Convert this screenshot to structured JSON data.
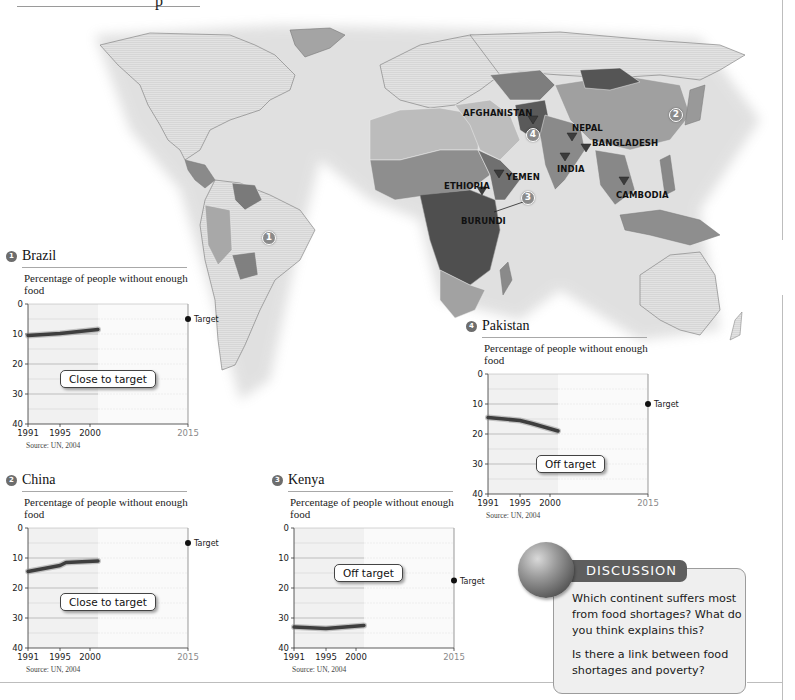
{
  "page": {
    "header_fragment": "p"
  },
  "map": {
    "country_labels": [
      {
        "name": "AFGHANISTAN",
        "x": 463,
        "y": 108
      },
      {
        "name": "NEPAL",
        "x": 572,
        "y": 123
      },
      {
        "name": "BANGLADESH",
        "x": 592,
        "y": 138
      },
      {
        "name": "INDIA",
        "x": 557,
        "y": 164
      },
      {
        "name": "YEMEN",
        "x": 506,
        "y": 172
      },
      {
        "name": "ETHIOPIA",
        "x": 444,
        "y": 181
      },
      {
        "name": "BURUNDI",
        "x": 461,
        "y": 216
      },
      {
        "name": "CAMBODIA",
        "x": 616,
        "y": 190
      }
    ],
    "markers": [
      {
        "num": "1",
        "x": 269,
        "y": 238
      },
      {
        "num": "2",
        "x": 676,
        "y": 115
      },
      {
        "num": "3",
        "x": 528,
        "y": 198
      },
      {
        "num": "4",
        "x": 533,
        "y": 135
      }
    ],
    "hunger_triangles": [
      {
        "country": "AFGHANISTAN",
        "x": 533,
        "y": 120
      },
      {
        "country": "NEPAL",
        "x": 572,
        "y": 137
      },
      {
        "country": "BANGLADESH",
        "x": 586,
        "y": 148
      },
      {
        "country": "INDIA",
        "x": 565,
        "y": 157
      },
      {
        "country": "YEMEN",
        "x": 499,
        "y": 174
      },
      {
        "country": "ETHIOPIA",
        "x": 482,
        "y": 191
      },
      {
        "country": "CAMBODIA",
        "x": 624,
        "y": 181
      }
    ],
    "shade_colors": {
      "lowest": "#e6e6e6",
      "low": "#bdbdbd",
      "medium": "#9a9a9a",
      "high": "#777777",
      "highest": "#4f4f4f"
    }
  },
  "charts": {
    "brazil": {
      "num": "1",
      "title": "Brazil",
      "subtitle": "Percentage of people without enough food",
      "status": "Close to target",
      "source": "Source: UN, 2004",
      "target_label": "Target"
    },
    "china": {
      "num": "2",
      "title": "China",
      "subtitle": "Percentage of people without enough food",
      "status": "Close to target",
      "source": "Source: UN, 2004",
      "target_label": "Target"
    },
    "kenya": {
      "num": "3",
      "title": "Kenya",
      "subtitle": "Percentage of people without enough food",
      "status": "Off target",
      "source": "Source: UN, 2004",
      "target_label": "Target"
    },
    "pakistan": {
      "num": "4",
      "title": "Pakistan",
      "subtitle": "Percentage of people without enough food",
      "status": "Off target",
      "source": "Source: UN, 2004",
      "target_label": "Target"
    }
  },
  "discussion": {
    "title": "DISCUSSION",
    "question1": "Which continent suffers most from food shortages? What do you think explains this?",
    "question2": "Is there a link between food shortages and poverty?"
  },
  "chart_data": [
    {
      "type": "line",
      "title": "Brazil — Percentage of people without enough food",
      "xlabel": "",
      "ylabel": "Percentage of people without enough food",
      "x_ticks": [
        "1991",
        "1995",
        "2000",
        "2015"
      ],
      "y_ticks": [
        0,
        10,
        20,
        30,
        40
      ],
      "ylim": [
        40,
        0
      ],
      "y_inverted": true,
      "x": [
        1991,
        1995,
        2001
      ],
      "series": [
        {
          "name": "Brazil",
          "values": [
            10.5,
            9.8,
            8.5
          ]
        }
      ],
      "target": {
        "x": 2015,
        "y": 5,
        "label": "Target"
      },
      "annotation": "Close to target",
      "source": "Source: UN, 2004",
      "grid": true
    },
    {
      "type": "line",
      "title": "China — Percentage of people without enough food",
      "xlabel": "",
      "ylabel": "Percentage of people without enough food",
      "x_ticks": [
        "1991",
        "1995",
        "2000",
        "2015"
      ],
      "y_ticks": [
        0,
        10,
        20,
        30,
        40
      ],
      "ylim": [
        40,
        0
      ],
      "y_inverted": true,
      "x": [
        1991,
        1995,
        1996,
        2001
      ],
      "series": [
        {
          "name": "China",
          "values": [
            14.5,
            12.5,
            11.5,
            11
          ]
        }
      ],
      "target": {
        "x": 2015,
        "y": 5,
        "label": "Target"
      },
      "annotation": "Close to target",
      "source": "Source: UN, 2004",
      "grid": true
    },
    {
      "type": "line",
      "title": "Kenya — Percentage of people without enough food",
      "xlabel": "",
      "ylabel": "Percentage of people without enough food",
      "x_ticks": [
        "1991",
        "1995",
        "2000",
        "2015"
      ],
      "y_ticks": [
        0,
        10,
        20,
        30,
        40
      ],
      "ylim": [
        40,
        0
      ],
      "y_inverted": true,
      "x": [
        1991,
        1995,
        2001
      ],
      "series": [
        {
          "name": "Kenya",
          "values": [
            33,
            33.5,
            32.5
          ]
        }
      ],
      "target": {
        "x": 2015,
        "y": 17.5,
        "label": "Target"
      },
      "annotation": "Off target",
      "source": "Source: UN, 2004",
      "grid": true
    },
    {
      "type": "line",
      "title": "Pakistan — Percentage of people without enough food",
      "xlabel": "",
      "ylabel": "Percentage of people without enough food",
      "x_ticks": [
        "1991",
        "1995",
        "2000",
        "2015"
      ],
      "y_ticks": [
        0,
        10,
        20,
        30,
        40
      ],
      "ylim": [
        40,
        0
      ],
      "y_inverted": true,
      "x": [
        1991,
        1995,
        1997,
        2001
      ],
      "series": [
        {
          "name": "Pakistan",
          "values": [
            14.5,
            15.5,
            16.5,
            19
          ]
        }
      ],
      "target": {
        "x": 2015,
        "y": 10,
        "label": "Target"
      },
      "annotation": "Off target",
      "source": "Source: UN, 2004",
      "grid": true
    }
  ]
}
